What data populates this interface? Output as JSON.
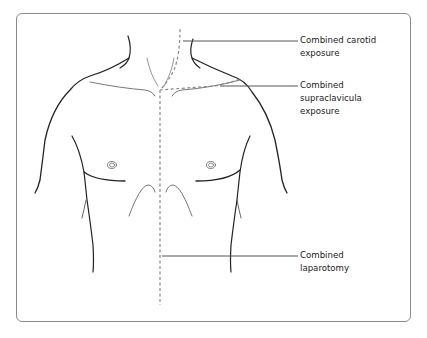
{
  "figure": {
    "labels": [
      {
        "id": "carotid",
        "lines": [
          "Combined carotid",
          "exposure"
        ]
      },
      {
        "id": "supraclavicular",
        "lines": [
          "Combined",
          "supraclavicula",
          "exposure"
        ]
      },
      {
        "id": "laparotomy",
        "lines": [
          "Combined",
          "laparotomy"
        ]
      }
    ],
    "colors": {
      "outline": "#222222",
      "incision_dashed": "#888888",
      "leader_line": "#555555",
      "frame_border": "#8a8a8a"
    }
  }
}
